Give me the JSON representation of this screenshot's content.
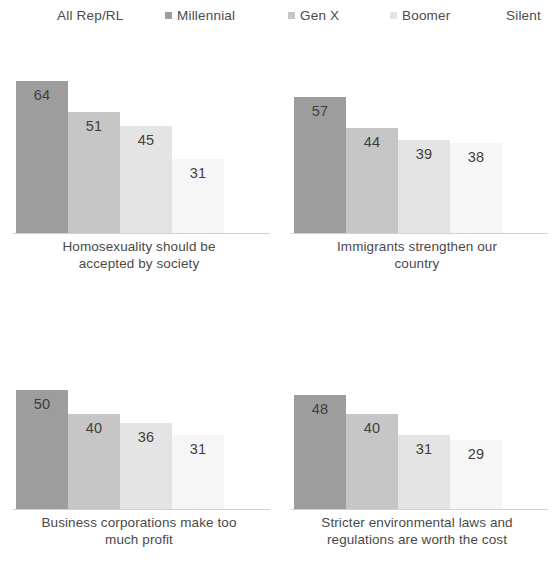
{
  "legend": {
    "items": [
      {
        "label": "All Rep/RL",
        "color": "transparent",
        "marker": false
      },
      {
        "label": "Millennial",
        "color": "#9d9d9d",
        "marker": true
      },
      {
        "label": "Gen X",
        "color": "#c6c6c6",
        "marker": true
      },
      {
        "label": "Boomer",
        "color": "#e4e4e4",
        "marker": true
      },
      {
        "label": "Silent",
        "color": "#f6f6f6",
        "marker": false
      }
    ]
  },
  "chart_data": {
    "type": "bar",
    "title": "",
    "subtitle": "",
    "xlabel": "",
    "ylabel": "",
    "ylim": [
      0,
      70
    ],
    "grid": false,
    "legend_position": "top",
    "categories": [
      "All Rep/RL",
      "Millennial",
      "Gen X",
      "Boomer",
      "Silent"
    ],
    "series_colors": [
      "transparent",
      "#9d9d9d",
      "#c6c6c6",
      "#e4e4e4",
      "#f6f6f6"
    ],
    "panels": [
      {
        "caption": "Homosexuality should be accepted by society",
        "caption_line1": "Homosexuality should be",
        "caption_line2": "accepted by society",
        "values": [
          49,
          64,
          51,
          45,
          31
        ],
        "bars": [
          false,
          true,
          true,
          true,
          true
        ]
      },
      {
        "caption": "Immigrants strengthen our country",
        "caption_line1": "Immigrants strengthen our",
        "caption_line2": "country",
        "values": [
          44,
          57,
          44,
          39,
          38
        ],
        "bars": [
          false,
          true,
          true,
          true,
          true
        ]
      },
      {
        "caption": "Business corporations make too much profit",
        "caption_line1": "Business corporations make too",
        "caption_line2": "much profit",
        "values": [
          40,
          50,
          40,
          36,
          31
        ],
        "bars": [
          false,
          true,
          true,
          true,
          true
        ]
      },
      {
        "caption": "Stricter environmental laws and regulations are worth the cost",
        "caption_line1": "Stricter environmental laws and",
        "caption_line2": "regulations are worth the cost",
        "values": [
          37,
          48,
          40,
          31,
          29
        ],
        "bars": [
          false,
          true,
          true,
          true,
          true
        ]
      }
    ]
  }
}
